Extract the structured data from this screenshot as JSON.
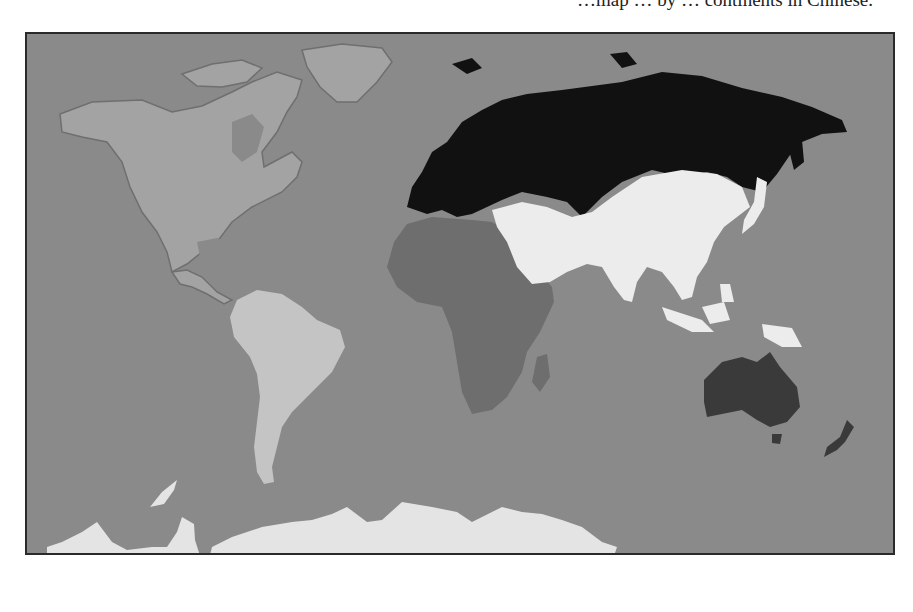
{
  "caption": "…map … by … continents in Chinese.",
  "map": {
    "ocean_color": "#8a8a8a",
    "regions": [
      {
        "name": "North America",
        "fill": "#a3a3a3"
      },
      {
        "name": "South America",
        "fill": "#c4c4c4"
      },
      {
        "name": "Europe and Russia",
        "fill": "#111111"
      },
      {
        "name": "Asia",
        "fill": "#ececec"
      },
      {
        "name": "Africa",
        "fill": "#6e6e6e"
      },
      {
        "name": "Oceania",
        "fill": "#3a3a3a"
      },
      {
        "name": "Antarctica",
        "fill": "#e4e4e4"
      }
    ]
  }
}
